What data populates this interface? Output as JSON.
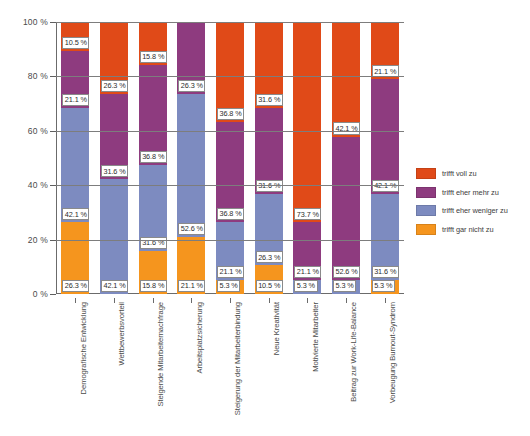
{
  "chart_data": {
    "type": "bar",
    "subtype": "stacked-bar-100-percent",
    "title": "",
    "xlabel": "",
    "ylabel": "",
    "ylim": [
      0,
      100
    ],
    "ytick_labels": [
      "0 %",
      "20 %",
      "40 %",
      "60 %",
      "80 %",
      "100 %"
    ],
    "ytick_values": [
      0,
      20,
      40,
      60,
      80,
      100
    ],
    "grid": true,
    "legend_position": "right",
    "value_suffix": " %",
    "categories": [
      "Demografische Entwicklung",
      "Wettbewerbsvorteil",
      "Steigende Mitarbeiternachfrage",
      "Arbeitsplatzsicherung",
      "Steigerung der Mitarbeiterbindung",
      "Neue Kreativität",
      "Motivierte Mitarbeiter",
      "Beitrag zur Work-Life-Balance",
      "Vorbeugung Burnout-Syndrom"
    ],
    "series": [
      {
        "name": "trifft voll zu",
        "color": "#E04A18",
        "values": [
          10.5,
          26.3,
          15.8,
          0,
          36.8,
          31.6,
          73.7,
          42.1,
          21.1
        ],
        "labels": [
          "10.5 %",
          "26.3 %",
          "15.8 %",
          "",
          "36.8 %",
          "31.6 %",
          "73.7 %",
          "42.1 %",
          "21.1 %"
        ]
      },
      {
        "name": "trifft eher mehr zu",
        "color": "#8E3B7F",
        "values": [
          21.1,
          31.6,
          36.8,
          26.3,
          36.8,
          31.6,
          21.1,
          52.6,
          42.1
        ],
        "labels": [
          "21.1 %",
          "31.6 %",
          "36.8 %",
          "26.3 %",
          "36.8 %",
          "31.6 %",
          "21.1 %",
          "52.6 %",
          "42.1 %"
        ]
      },
      {
        "name": "trifft eher weniger zu",
        "color": "#7D8BC0",
        "values": [
          42.1,
          42.1,
          31.6,
          52.6,
          21.1,
          26.3,
          5.3,
          5.3,
          31.6
        ],
        "labels": [
          "42.1 %",
          "42.1 %",
          "31.6 %",
          "52.6 %",
          "21.1 %",
          "26.3 %",
          "5.3 %",
          "5.3 %",
          "31.6 %"
        ]
      },
      {
        "name": "trifft gar nicht zu",
        "color": "#F5951E",
        "values": [
          26.3,
          0,
          15.8,
          21.1,
          5.3,
          10.5,
          0,
          0,
          5.3
        ],
        "labels": [
          "26.3 %",
          "",
          "15.8 %",
          "21.1 %",
          "5.3 %",
          "10.5 %",
          "",
          "",
          "5.3 %"
        ]
      }
    ]
  },
  "legend": {
    "items": [
      {
        "label": "trifft voll zu",
        "color": "#E04A18"
      },
      {
        "label": "trifft eher mehr zu",
        "color": "#8E3B7F"
      },
      {
        "label": "trifft eher weniger zu",
        "color": "#7D8BC0"
      },
      {
        "label": "trifft gar nicht zu",
        "color": "#F5951E"
      }
    ]
  }
}
